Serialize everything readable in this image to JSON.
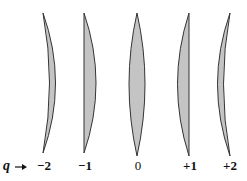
{
  "diagram": {
    "axis_label": "q",
    "arrow_icon": "right-arrow-icon",
    "fill_color": "#c4c4c4",
    "stroke_color": "#333333",
    "lenses": [
      {
        "q": "−2",
        "shape": "meniscus (bulges right)",
        "bold": true
      },
      {
        "q": "−1",
        "shape": "plano-convex (flat left)",
        "bold": true
      },
      {
        "q": "0",
        "shape": "symmetric biconvex",
        "bold": false
      },
      {
        "q": "+1",
        "shape": "plano-convex (flat right)",
        "bold": true
      },
      {
        "q": "+2",
        "shape": "meniscus (bulges left)",
        "bold": true
      }
    ]
  }
}
